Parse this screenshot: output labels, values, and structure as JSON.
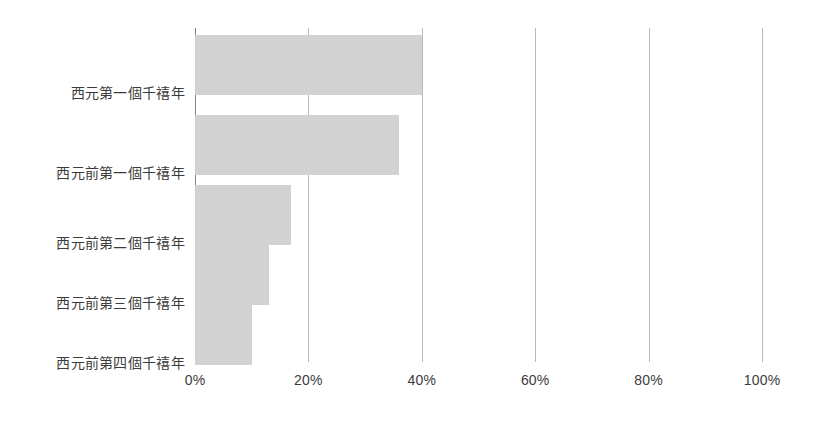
{
  "chart_data": {
    "type": "bar",
    "orientation": "horizontal",
    "title": "",
    "subtitle": "",
    "xlabel": "",
    "ylabel": "",
    "xlim": [
      0,
      100
    ],
    "grid": true,
    "legend": false,
    "legend_position": "none",
    "value_suffix": "%",
    "categories": [
      "西元第一個千禧年",
      "西元前第一個千禧年",
      "西元前第二個千禧年",
      "西元前第三個千禧年",
      "西元前第四個千禧年"
    ],
    "values": [
      40,
      36,
      17,
      13,
      10
    ],
    "xticks": [
      0,
      20,
      40,
      60,
      80,
      100
    ],
    "xtick_labels": [
      "0%",
      "20%",
      "40%",
      "60%",
      "80%",
      "100%"
    ],
    "colors": {
      "bar_fill": "#d2d2d2",
      "gridline": "#b9b9b9",
      "axis_line": "#808080",
      "text": "#3c3c3c",
      "background": "#ffffff"
    }
  }
}
